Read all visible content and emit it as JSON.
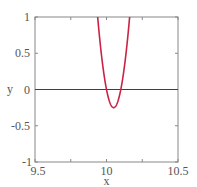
{
  "chart_data": {
    "type": "line",
    "title": "",
    "xlabel": "x",
    "ylabel": "y",
    "xlim": [
      9.5,
      10.5
    ],
    "ylim": [
      -1,
      1
    ],
    "grid": false,
    "legend": null,
    "x_ticks": [
      {
        "value": 9.5,
        "label": "9.5"
      },
      {
        "value": 10,
        "label": "10"
      },
      {
        "value": 10.5,
        "label": "10.5"
      }
    ],
    "x_minor_ticks": [
      9.75,
      10.25
    ],
    "y_ticks": [
      {
        "value": 1,
        "label": "1"
      },
      {
        "value": 0.5,
        "label": "0.5"
      },
      {
        "value": 0,
        "label": "0"
      },
      {
        "value": -0.5,
        "label": "-0.5"
      },
      {
        "value": -1,
        "label": "-1"
      }
    ],
    "series": [
      {
        "name": "y = 100(x - 10)(x - 10.1)",
        "color": "#cc2244",
        "expression": "100*(x-10)*(x-10.1)",
        "x": [
          9.938,
          9.95,
          9.97,
          9.99,
          10.0,
          10.02,
          10.04,
          10.05,
          10.06,
          10.08,
          10.1,
          10.12,
          10.14,
          10.162
        ],
        "y": [
          1.0,
          0.75,
          0.39,
          0.11,
          0.0,
          -0.16,
          -0.24,
          -0.25,
          -0.24,
          -0.16,
          0.0,
          0.24,
          0.56,
          1.0
        ]
      },
      {
        "name": "y = 0",
        "color": "#3a3a6a",
        "x": [
          9.5,
          10.5
        ],
        "y": [
          0,
          0
        ]
      }
    ]
  },
  "colors": {
    "frame": "#888888",
    "curve": "#cc2244",
    "zero_line": "#3a3a6a",
    "text": "#555555"
  }
}
